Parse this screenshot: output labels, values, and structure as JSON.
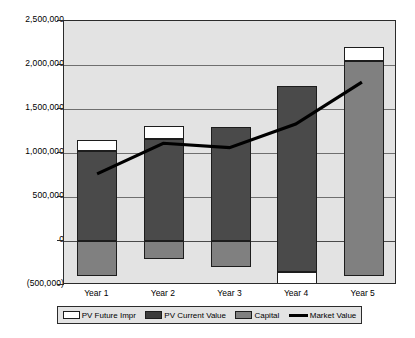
{
  "chart_data": {
    "type": "bar",
    "title": "",
    "xlabel": "",
    "ylabel": "",
    "categories": [
      "Year 1",
      "Year 2",
      "Year 3",
      "Year 4",
      "Year 5"
    ],
    "ylim": [
      -500000,
      2500000
    ],
    "yticks": [
      2500000,
      2000000,
      1500000,
      1000000,
      500000,
      0,
      -500000
    ],
    "ytick_labels": [
      "2,500,000",
      "2,000,000",
      "1,500,000",
      "1,000,000",
      "500,000",
      "0",
      "(500,000)"
    ],
    "grid": true,
    "stacked": true,
    "legend_position": "bottom",
    "series": [
      {
        "name": "PV Future Impr",
        "type": "bar",
        "color": "#ffffff",
        "values": [
          130000,
          150000,
          0,
          150000,
          150000
        ]
      },
      {
        "name": "PV Current Value",
        "type": "bar",
        "color": "#4a4a4a",
        "values": [
          1020000,
          1160000,
          1300000,
          1760000,
          0
        ]
      },
      {
        "name": "Capital",
        "type": "bar",
        "color": "#808080",
        "values": [
          -400000,
          -200000,
          -300000,
          0,
          2050000
        ]
      },
      {
        "name": "Market Value",
        "type": "line",
        "color": "#000000",
        "values": [
          750000,
          1100000,
          1050000,
          1320000,
          1800000
        ]
      }
    ],
    "bars": [
      {
        "category": "Year 1",
        "segments": [
          {
            "series": "Capital",
            "from": -400000,
            "to": 0,
            "fill": "capital"
          },
          {
            "series": "PV Current Value",
            "from": 0,
            "to": 1020000,
            "fill": "current"
          },
          {
            "series": "PV Future Impr",
            "from": 1020000,
            "to": 1150000,
            "fill": "future"
          }
        ]
      },
      {
        "category": "Year 2",
        "segments": [
          {
            "series": "Capital",
            "from": -200000,
            "to": 0,
            "fill": "capital"
          },
          {
            "series": "PV Current Value",
            "from": 0,
            "to": 1160000,
            "fill": "current"
          },
          {
            "series": "PV Future Impr",
            "from": 1160000,
            "to": 1310000,
            "fill": "future"
          }
        ]
      },
      {
        "category": "Year 3",
        "segments": [
          {
            "series": "Capital",
            "from": -300000,
            "to": 0,
            "fill": "capital"
          },
          {
            "series": "PV Current Value",
            "from": 0,
            "to": 1300000,
            "fill": "current"
          }
        ]
      },
      {
        "category": "Year 4",
        "segments": [
          {
            "series": "PV Future Impr",
            "from": -500000,
            "to": -350000,
            "fill": "future"
          },
          {
            "series": "PV Current Value",
            "from": -350000,
            "to": 1760000,
            "fill": "current"
          }
        ]
      },
      {
        "category": "Year 5",
        "segments": [
          {
            "series": "Capital",
            "from": -400000,
            "to": 2050000,
            "fill": "capital"
          },
          {
            "series": "PV Future Impr",
            "from": 2050000,
            "to": 2200000,
            "fill": "future"
          }
        ]
      }
    ]
  },
  "legend": {
    "items": [
      {
        "label": "PV Future Impr",
        "swatch": "future"
      },
      {
        "label": "PV Current Value",
        "swatch": "current"
      },
      {
        "label": "Capital",
        "swatch": "capital"
      },
      {
        "label": "Market Value",
        "swatch": "line"
      }
    ]
  }
}
